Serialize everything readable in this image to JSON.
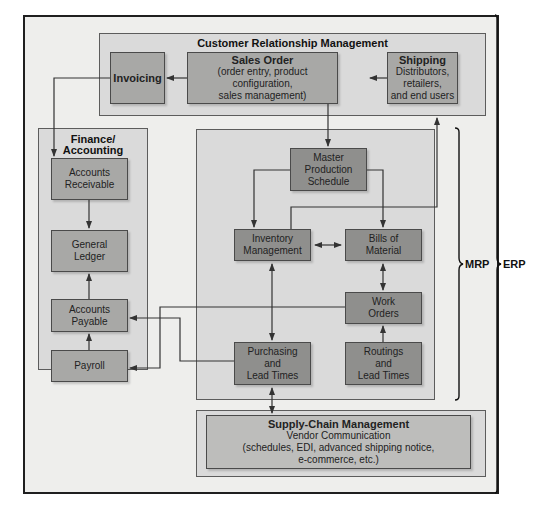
{
  "diagram": {
    "crm": {
      "title": "Customer Relationship Management",
      "invoicing": "Invoicing",
      "sales_order": {
        "title": "Sales Order",
        "line1": "(order entry, product configuration,",
        "line2": "sales management)"
      },
      "shipping": {
        "title": "Shipping",
        "line1": "Distributors,",
        "line2": "retailers,",
        "line3": "and end users"
      }
    },
    "finance": {
      "title_line1": "Finance/",
      "title_line2": "Accounting",
      "accounts_receivable": [
        "Accounts",
        "Receivable"
      ],
      "general_ledger": [
        "General",
        "Ledger"
      ],
      "accounts_payable": [
        "Accounts",
        "Payable"
      ],
      "payroll": "Payroll"
    },
    "mrp": {
      "master_production_schedule": [
        "Master",
        "Production",
        "Schedule"
      ],
      "inventory_management": [
        "Inventory",
        "Management"
      ],
      "bills_of_material": [
        "Bills of",
        "Material"
      ],
      "work_orders": [
        "Work",
        "Orders"
      ],
      "purchasing": [
        "Purchasing",
        "and",
        "Lead Times"
      ],
      "routings": [
        "Routings",
        "and",
        "Lead Times"
      ]
    },
    "scm": {
      "title": "Supply-Chain Management",
      "line1": "Vendor Communication",
      "line2": "(schedules, EDI, advanced shipping notice,",
      "line3": "e-commerce, etc.)"
    },
    "braces": {
      "mrp_label": "MRP",
      "erp_label": "ERP"
    },
    "colors": {
      "frame_bg": "#eeeeec",
      "group_bg": "#dadada",
      "node_bg": "#a8a8a6",
      "node_dark_bg": "#8f8f8d",
      "line": "#333333"
    }
  }
}
